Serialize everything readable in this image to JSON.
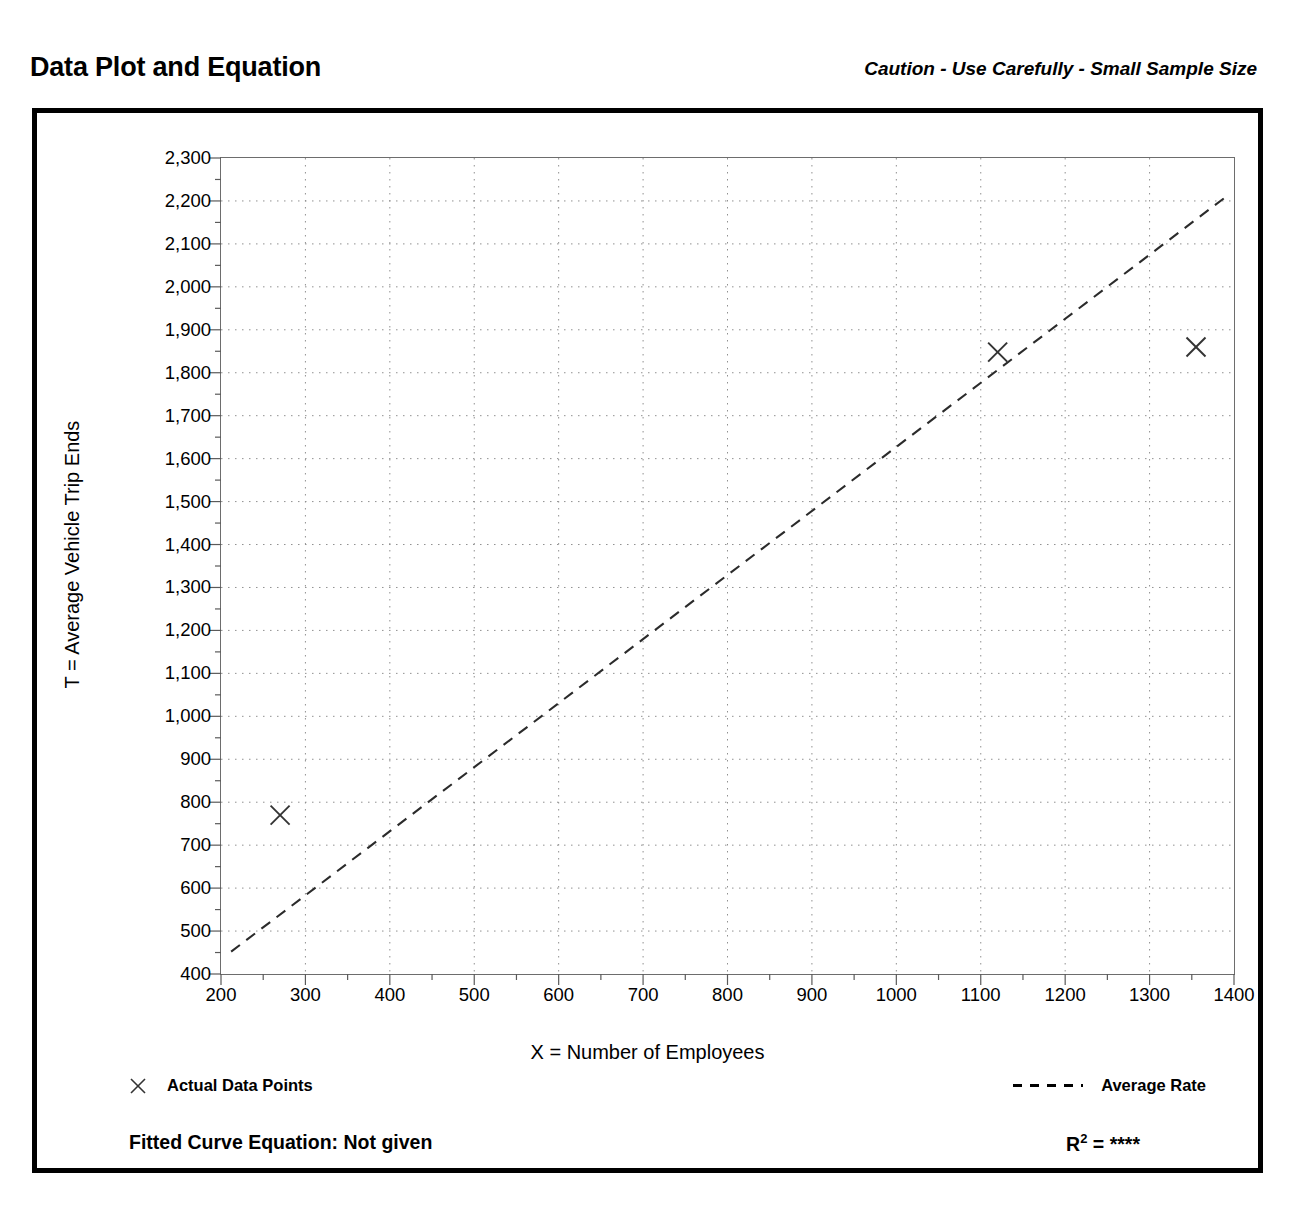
{
  "header": {
    "title": "Data Plot and Equation",
    "caution": "Caution - Use Carefully - Small Sample Size"
  },
  "footer": {
    "fitted_curve_label": "Fitted Curve Equation:  Not given",
    "r_squared_prefix": "R",
    "r_squared_exponent": "2",
    "r_squared_value": "= ****"
  },
  "chart_data": {
    "type": "scatter",
    "title": "Data Plot and Equation",
    "xlabel": "X = Number of Employees",
    "ylabel": "T = Average Vehicle Trip Ends",
    "xlim": [
      200,
      1400
    ],
    "ylim": [
      400,
      2300
    ],
    "xticks": [
      200,
      300,
      400,
      500,
      600,
      700,
      800,
      900,
      1000,
      1100,
      1200,
      1300,
      1400
    ],
    "xtick_labels": [
      "200",
      "300",
      "400",
      "500",
      "600",
      "700",
      "800",
      "900",
      "1000",
      "1100",
      "1200",
      "1300",
      "1400"
    ],
    "yticks": [
      400,
      500,
      600,
      700,
      800,
      900,
      1000,
      1100,
      1200,
      1300,
      1400,
      1500,
      1600,
      1700,
      1800,
      1900,
      2000,
      2100,
      2200,
      2300
    ],
    "ytick_labels": [
      "400",
      "500",
      "600",
      "700",
      "800",
      "900",
      "1,000",
      "1,100",
      "1,200",
      "1,300",
      "1,400",
      "1,500",
      "1,600",
      "1,700",
      "1,800",
      "1,900",
      "2,000",
      "2,100",
      "2,200",
      "2,300"
    ],
    "x_minor_interval": 50,
    "y_minor_interval": 50,
    "grid": true,
    "grid_style": "dotted",
    "legend_position": "below-plot",
    "series": [
      {
        "name": "Actual Data Points",
        "type": "scatter",
        "marker": "x",
        "points": [
          {
            "x": 270,
            "y": 770
          },
          {
            "x": 1120,
            "y": 1848
          },
          {
            "x": 1355,
            "y": 1860
          }
        ]
      },
      {
        "name": "Average Rate",
        "type": "line",
        "style": "dashed",
        "points": [
          {
            "x": 212,
            "y": 452
          },
          {
            "x": 1392,
            "y": 2212
          }
        ]
      }
    ]
  }
}
